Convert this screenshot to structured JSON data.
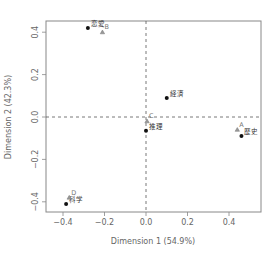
{
  "chart_data": {
    "type": "scatter",
    "title": "",
    "xlabel": "Dimension 1 (54.9%)",
    "ylabel": "Dimension 2 (42.3%)",
    "xlim": [
      -0.45,
      0.55
    ],
    "ylim": [
      -0.42,
      0.45
    ],
    "xticks": [
      -0.4,
      -0.2,
      0.0,
      0.2,
      0.4
    ],
    "yticks": [
      -0.4,
      -0.2,
      0.0,
      0.2,
      0.4
    ],
    "xtick_labels": [
      "−0.4",
      "−0.2",
      "0.0",
      "0.2",
      "0.4"
    ],
    "ytick_labels": [
      "−0.4",
      "−0.2",
      "0.0",
      "0.2",
      "0.4"
    ],
    "grid": false,
    "reference_lines": {
      "x": 0.0,
      "y": 0.0,
      "style": "dashed"
    },
    "series": [
      {
        "name": "genres",
        "marker": "filled-circle",
        "points": [
          {
            "label": "恋愛",
            "x": -0.28,
            "y": 0.42
          },
          {
            "label": "経済",
            "x": 0.1,
            "y": 0.09
          },
          {
            "label": "推理",
            "x": 0.0,
            "y": -0.065
          },
          {
            "label": "歴史",
            "x": 0.46,
            "y": -0.09
          },
          {
            "label": "科学",
            "x": -0.385,
            "y": -0.41
          }
        ]
      },
      {
        "name": "groups",
        "marker": "triangle",
        "points": [
          {
            "label": "A",
            "x": 0.44,
            "y": -0.06
          },
          {
            "label": "B",
            "x": -0.21,
            "y": 0.4
          },
          {
            "label": "C",
            "x": 0.005,
            "y": -0.02
          },
          {
            "label": "D",
            "x": -0.37,
            "y": -0.38
          }
        ]
      }
    ]
  }
}
